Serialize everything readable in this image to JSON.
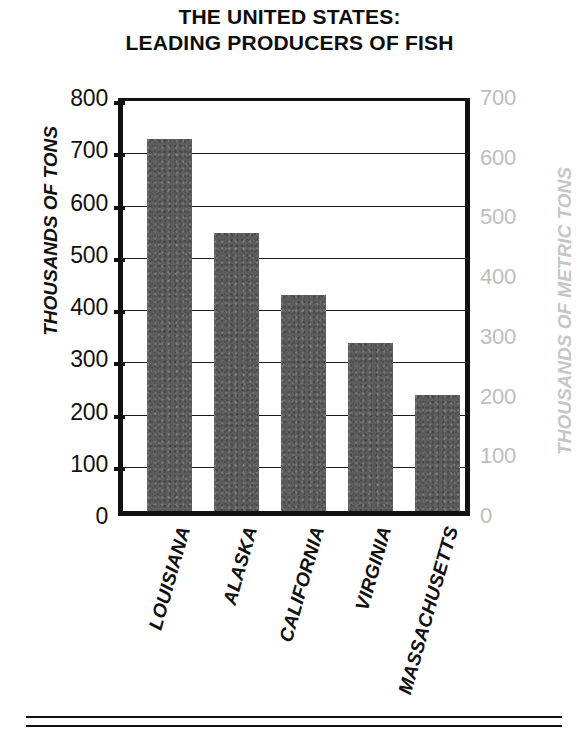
{
  "title": {
    "line1": "THE UNITED STATES:",
    "line2": "LEADING PRODUCERS OF FISH"
  },
  "axes": {
    "left_title": "THOUSANDS OF TONS",
    "right_title": "THOUSANDS OF METRIC TONS",
    "left_ticks": [
      "800",
      "700",
      "600",
      "500",
      "400",
      "300",
      "200",
      "100",
      "0"
    ],
    "right_ticks": [
      "700",
      "600",
      "500",
      "400",
      "300",
      "200",
      "100",
      "0"
    ],
    "right_tick_color": "#bdbdbd"
  },
  "chart_data": {
    "type": "bar",
    "title": "THE UNITED STATES: LEADING PRODUCERS OF FISH",
    "xlabel": "",
    "ylabel": "THOUSANDS OF TONS",
    "y2label": "THOUSANDS OF METRIC TONS",
    "categories": [
      "LOUISIANA",
      "ALASKA",
      "CALIFORNIA",
      "VIRGINIA",
      "MASSACHUSETTS"
    ],
    "values": [
      712,
      532,
      413,
      321,
      222
    ],
    "ylim": [
      0,
      800
    ],
    "yticks": [
      0,
      100,
      200,
      300,
      400,
      500,
      600,
      700,
      800
    ],
    "y2lim": [
      0,
      700
    ],
    "y2ticks": [
      0,
      100,
      200,
      300,
      400,
      500,
      600,
      700
    ],
    "grid": true,
    "legend": false,
    "bar_color": "#5d5d5d",
    "units": "thousands of tons"
  }
}
